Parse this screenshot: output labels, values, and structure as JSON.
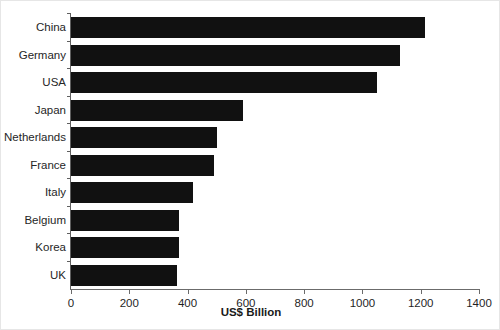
{
  "chart_data": {
    "type": "bar",
    "orientation": "horizontal",
    "title": "",
    "xlabel": "US$ Billion",
    "ylabel": "",
    "xlim": [
      0,
      1400
    ],
    "ylim": null,
    "grid": false,
    "legend": null,
    "xticks": [
      0,
      200,
      400,
      600,
      800,
      1000,
      1200,
      1400
    ],
    "xtick_labels": [
      "0",
      "200",
      "400",
      "600",
      "800",
      "1000",
      "1200",
      "1400"
    ],
    "categories": [
      "China",
      "Germany",
      "USA",
      "Japan",
      "Netherlands",
      "France",
      "Italy",
      "Belgium",
      "Korea",
      "UK"
    ],
    "values": [
      1215,
      1130,
      1050,
      590,
      500,
      490,
      420,
      372,
      369,
      365
    ],
    "bar_color": "#111111",
    "axis_color": "#6b6b6b"
  }
}
